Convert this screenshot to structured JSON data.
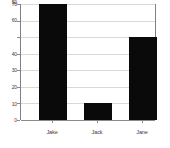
{
  "chart_data": {
    "type": "bar",
    "title": "",
    "subtitle": "",
    "xlabel": "",
    "ylabel": "",
    "categories": [
      "Jake",
      "Jack",
      "Jane"
    ],
    "values": [
      70,
      10,
      50
    ],
    "series": [
      {
        "name": "",
        "values": [
          70,
          10,
          50
        ]
      }
    ],
    "ylim": [
      0,
      70
    ],
    "y_ticks": [
      0,
      10,
      20,
      30,
      40,
      50,
      60,
      70
    ],
    "y_tick_labels": [
      "0",
      "10",
      "20",
      "30",
      "40",
      "50",
      "60",
      "70"
    ],
    "grid": true,
    "legend": false,
    "legend_position": "none",
    "bar_color": "#0a0a0a",
    "gridline_color": "#d9d9d9",
    "axis_color": "#808080",
    "background_color": "#ffffff",
    "tick_label_color": "#3a3a3a"
  }
}
